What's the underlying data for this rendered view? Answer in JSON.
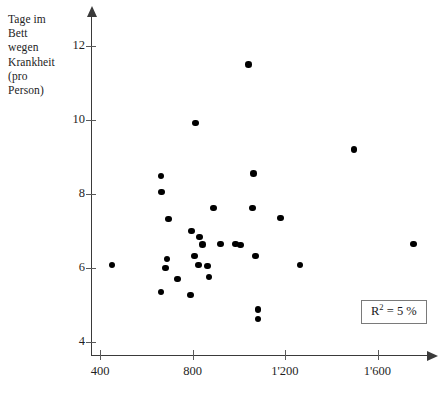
{
  "chart_data": {
    "type": "scatter",
    "title": "",
    "ylabel": "Tage im Bett wegen Krankheit (pro Person)",
    "ylabel_lines": "Tage im\nBett\nwegen\nKrankheit\n(pro\nPerson)",
    "xlabel": "",
    "xlim": [
      330,
      1780
    ],
    "ylim": [
      3.5,
      12.6
    ],
    "yticks": [
      12,
      10,
      8,
      6,
      4
    ],
    "ytick_labels": [
      "12",
      "10",
      "8",
      "6",
      "4"
    ],
    "xticks": [
      400,
      800,
      1200,
      1600
    ],
    "xtick_labels": [
      "400",
      "800",
      "1'200",
      "1'600"
    ],
    "grid": false,
    "legend": "none",
    "marker_color": "#000000",
    "axis_color": "#3a3a3a",
    "annotation": {
      "text_prefix": "R",
      "text_exponent": "2",
      "text_suffix": " = 5 %",
      "full_text": "R2 = 5 %"
    },
    "points": [
      {
        "x": 452,
        "y": 6.08
      },
      {
        "x": 663,
        "y": 5.35
      },
      {
        "x": 663,
        "y": 8.49
      },
      {
        "x": 667,
        "y": 8.05
      },
      {
        "x": 697,
        "y": 7.32
      },
      {
        "x": 689,
        "y": 6.24
      },
      {
        "x": 684,
        "y": 6.0
      },
      {
        "x": 736,
        "y": 5.7
      },
      {
        "x": 813,
        "y": 9.92
      },
      {
        "x": 791,
        "y": 5.27
      },
      {
        "x": 796,
        "y": 7.0
      },
      {
        "x": 809,
        "y": 6.32
      },
      {
        "x": 830,
        "y": 6.84
      },
      {
        "x": 843,
        "y": 6.64
      },
      {
        "x": 826,
        "y": 6.08
      },
      {
        "x": 865,
        "y": 6.06
      },
      {
        "x": 891,
        "y": 7.62
      },
      {
        "x": 872,
        "y": 5.76
      },
      {
        "x": 920,
        "y": 6.65
      },
      {
        "x": 985,
        "y": 6.65
      },
      {
        "x": 1043,
        "y": 11.5
      },
      {
        "x": 1064,
        "y": 8.55
      },
      {
        "x": 1059,
        "y": 7.62
      },
      {
        "x": 1008,
        "y": 6.62
      },
      {
        "x": 1073,
        "y": 6.32
      },
      {
        "x": 1083,
        "y": 4.88
      },
      {
        "x": 1083,
        "y": 4.62
      },
      {
        "x": 1180,
        "y": 7.35
      },
      {
        "x": 1265,
        "y": 6.08
      },
      {
        "x": 1498,
        "y": 9.2
      },
      {
        "x": 1756,
        "y": 6.65
      }
    ]
  }
}
